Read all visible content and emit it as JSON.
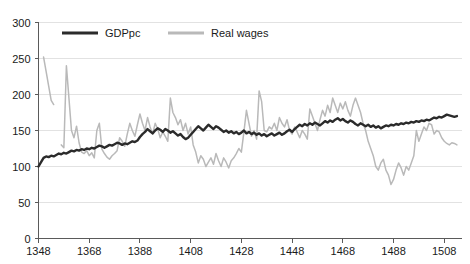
{
  "chart_data": {
    "type": "line",
    "title": "",
    "subtitle": "",
    "xlabel": "",
    "ylabel": "",
    "xlim": [
      1348,
      1515
    ],
    "ylim": [
      0,
      300
    ],
    "grid": true,
    "grid_axis": "y",
    "legend_position": "top-inside",
    "xticks": [
      1348,
      1368,
      1388,
      1408,
      1428,
      1448,
      1468,
      1488,
      1508
    ],
    "yticks": [
      0,
      50,
      100,
      150,
      200,
      250,
      300
    ],
    "xtick_labels": [
      "1348",
      "1368",
      "1388",
      "1408",
      "1428",
      "1448",
      "1468",
      "1488",
      "1508"
    ],
    "ytick_labels": [
      "0",
      "50",
      "100",
      "150",
      "200",
      "250",
      "300"
    ],
    "colors": {
      "gdppc": "#2b2b2b",
      "real_wages": "#b9b9b9",
      "grid": "#e2e2e2",
      "axis": "#5a5a5a",
      "text": "#1a1a1a",
      "background": "#ffffff"
    },
    "series": [
      {
        "name": "GDPpc",
        "color": "#2b2b2b",
        "x": [
          1348,
          1349,
          1350,
          1351,
          1352,
          1353,
          1354,
          1355,
          1356,
          1357,
          1358,
          1359,
          1360,
          1361,
          1362,
          1363,
          1364,
          1365,
          1366,
          1367,
          1368,
          1369,
          1370,
          1371,
          1372,
          1373,
          1374,
          1375,
          1376,
          1377,
          1378,
          1379,
          1380,
          1381,
          1382,
          1383,
          1384,
          1385,
          1386,
          1387,
          1388,
          1389,
          1390,
          1391,
          1392,
          1393,
          1394,
          1395,
          1396,
          1397,
          1398,
          1399,
          1400,
          1401,
          1402,
          1403,
          1404,
          1405,
          1406,
          1407,
          1408,
          1409,
          1410,
          1411,
          1412,
          1413,
          1414,
          1415,
          1416,
          1417,
          1418,
          1419,
          1420,
          1421,
          1422,
          1423,
          1424,
          1425,
          1426,
          1427,
          1428,
          1429,
          1430,
          1431,
          1432,
          1433,
          1434,
          1435,
          1436,
          1437,
          1438,
          1439,
          1440,
          1441,
          1442,
          1443,
          1444,
          1445,
          1446,
          1447,
          1448,
          1449,
          1450,
          1451,
          1452,
          1453,
          1454,
          1455,
          1456,
          1457,
          1458,
          1459,
          1460,
          1461,
          1462,
          1463,
          1464,
          1465,
          1466,
          1467,
          1468,
          1469,
          1470,
          1471,
          1472,
          1473,
          1474,
          1475,
          1476,
          1477,
          1478,
          1479,
          1480,
          1481,
          1482,
          1483,
          1484,
          1485,
          1486,
          1487,
          1488,
          1489,
          1490,
          1491,
          1492,
          1493,
          1494,
          1495,
          1496,
          1497,
          1498,
          1499,
          1500,
          1501,
          1502,
          1503,
          1504,
          1505,
          1506,
          1507,
          1508,
          1509,
          1510,
          1511,
          1512,
          1513
        ],
        "values": [
          100,
          106,
          112,
          114,
          113,
          115,
          114,
          116,
          118,
          117,
          119,
          118,
          120,
          122,
          121,
          123,
          122,
          124,
          123,
          125,
          124,
          126,
          125,
          127,
          129,
          128,
          126,
          128,
          130,
          129,
          131,
          133,
          132,
          130,
          132,
          131,
          133,
          135,
          134,
          136,
          141,
          145,
          148,
          152,
          149,
          146,
          150,
          153,
          151,
          148,
          152,
          150,
          147,
          149,
          146,
          143,
          145,
          141,
          138,
          140,
          144,
          148,
          152,
          156,
          153,
          150,
          154,
          158,
          155,
          152,
          156,
          154,
          151,
          148,
          150,
          147,
          149,
          146,
          148,
          145,
          147,
          150,
          146,
          148,
          145,
          147,
          144,
          146,
          143,
          145,
          142,
          144,
          146,
          143,
          145,
          147,
          144,
          146,
          149,
          151,
          148,
          152,
          155,
          158,
          156,
          159,
          157,
          160,
          158,
          161,
          159,
          157,
          160,
          163,
          161,
          164,
          162,
          165,
          167,
          164,
          166,
          163,
          161,
          164,
          162,
          159,
          157,
          160,
          158,
          156,
          158,
          155,
          157,
          154,
          156,
          153,
          155,
          157,
          156,
          158,
          157,
          159,
          158,
          160,
          159,
          161,
          160,
          162,
          161,
          163,
          162,
          164,
          163,
          165,
          164,
          166,
          168,
          167,
          169,
          168,
          170,
          172,
          171,
          170,
          169,
          170
        ],
        "start_value": 100,
        "end_value": 170,
        "notes": "Dark thick line, starts at 100 in 1348, rises steadily to about 170 by 1513"
      },
      {
        "name": "Real wages",
        "color": "#b9b9b9",
        "x": [
          1350,
          1351,
          1352,
          1353,
          1354,
          1355,
          1356,
          1357,
          1358,
          1359,
          1360,
          1361,
          1362,
          1363,
          1364,
          1365,
          1366,
          1367,
          1368,
          1369,
          1370,
          1371,
          1372,
          1373,
          1374,
          1375,
          1376,
          1377,
          1378,
          1379,
          1380,
          1381,
          1382,
          1383,
          1384,
          1385,
          1386,
          1387,
          1388,
          1389,
          1390,
          1391,
          1392,
          1393,
          1394,
          1395,
          1396,
          1397,
          1398,
          1399,
          1400,
          1401,
          1402,
          1403,
          1404,
          1405,
          1406,
          1407,
          1408,
          1409,
          1410,
          1411,
          1412,
          1413,
          1414,
          1415,
          1416,
          1417,
          1418,
          1419,
          1420,
          1421,
          1422,
          1423,
          1424,
          1425,
          1426,
          1427,
          1428,
          1429,
          1430,
          1431,
          1432,
          1433,
          1434,
          1435,
          1436,
          1437,
          1438,
          1439,
          1440,
          1441,
          1442,
          1443,
          1444,
          1445,
          1446,
          1447,
          1448,
          1449,
          1450,
          1451,
          1452,
          1453,
          1454,
          1455,
          1456,
          1457,
          1458,
          1459,
          1460,
          1461,
          1462,
          1463,
          1464,
          1465,
          1466,
          1467,
          1468,
          1469,
          1470,
          1471,
          1472,
          1473,
          1474,
          1475,
          1476,
          1477,
          1478,
          1479,
          1480,
          1481,
          1482,
          1483,
          1484,
          1485,
          1486,
          1487,
          1488,
          1489,
          1490,
          1491,
          1492,
          1493,
          1494,
          1495,
          1496,
          1497,
          1498,
          1499,
          1500,
          1501,
          1502,
          1503,
          1504,
          1505,
          1506,
          1507,
          1508,
          1509,
          1510,
          1511,
          1512,
          1513
        ],
        "values": [
          252,
          232,
          212,
          192,
          186,
          null,
          null,
          130,
          126,
          240,
          195,
          150,
          140,
          156,
          133,
          120,
          118,
          122,
          115,
          119,
          112,
          150,
          160,
          124,
          118,
          113,
          110,
          115,
          118,
          122,
          140,
          135,
          128,
          145,
          160,
          150,
          142,
          158,
          173,
          160,
          150,
          168,
          155,
          145,
          160,
          152,
          140,
          148,
          142,
          135,
          195,
          175,
          168,
          158,
          165,
          150,
          160,
          145,
          155,
          130,
          120,
          105,
          115,
          110,
          100,
          106,
          112,
          103,
          118,
          108,
          100,
          112,
          106,
          98,
          108,
          112,
          118,
          125,
          120,
          148,
          178,
          160,
          142,
          150,
          138,
          205,
          190,
          150,
          148,
          155,
          152,
          160,
          150,
          168,
          160,
          155,
          165,
          150,
          145,
          155,
          148,
          140,
          150,
          145,
          138,
          180,
          170,
          160,
          150,
          165,
          178,
          170,
          185,
          175,
          195,
          185,
          175,
          188,
          180,
          190,
          178,
          170,
          185,
          195,
          185,
          175,
          160,
          150,
          135,
          125,
          115,
          100,
          95,
          105,
          110,
          95,
          88,
          75,
          82,
          95,
          105,
          98,
          88,
          100,
          95,
          105,
          115,
          150,
          135,
          145,
          155,
          150,
          160,
          158,
          145,
          150,
          148,
          140,
          135,
          132,
          130,
          133,
          132,
          130
        ],
        "start_value": 252,
        "end_value": 130,
        "notes": "Light gray volatile line, starts very high around 250 in 1350, highly volatile, spikes around 240 in 1359 and 205 in 1435, dips below 80 in 1481, ends around 130"
      }
    ],
    "legend": [
      {
        "label": "GDPpc",
        "color": "#2b2b2b",
        "line_width": 3
      },
      {
        "label": "Real wages",
        "color": "#b9b9b9",
        "line_width": 3
      }
    ]
  },
  "figure": {
    "width": 470,
    "height": 264
  }
}
